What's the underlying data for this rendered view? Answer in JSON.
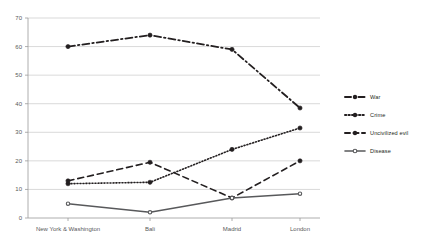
{
  "chart_data": {
    "type": "line",
    "title": "",
    "xlabel": "",
    "ylabel": "",
    "categories": [
      "New York & Washington",
      "Bali",
      "Madrid",
      "London"
    ],
    "ylim": [
      0,
      70
    ],
    "yticks": [
      0,
      10,
      20,
      30,
      40,
      50,
      60,
      70
    ],
    "grid": true,
    "legend_position": "right",
    "series": [
      {
        "name": "War",
        "values": [
          60,
          64,
          59,
          38.5
        ],
        "style": "dash-dot",
        "color": "#231f20"
      },
      {
        "name": "Crime",
        "values": [
          12,
          12.5,
          24,
          31.5
        ],
        "style": "dotted",
        "color": "#231f20"
      },
      {
        "name": "Uncivilized evil",
        "values": [
          13,
          19.5,
          7,
          20
        ],
        "style": "dashed",
        "color": "#231f20"
      },
      {
        "name": "Disease",
        "values": [
          5,
          2,
          7,
          8.5
        ],
        "style": "solid",
        "color": "#58595b"
      }
    ]
  },
  "axis": {
    "y_labels": [
      "70",
      "60",
      "50",
      "40",
      "30",
      "20",
      "10",
      "0"
    ],
    "x_labels": [
      "New York & Washington",
      "Bali",
      "Madrid",
      "London"
    ]
  },
  "legend": {
    "items": [
      {
        "label": "War"
      },
      {
        "label": "Crime"
      },
      {
        "label": "Uncivilized evil"
      },
      {
        "label": "Disease"
      }
    ]
  }
}
